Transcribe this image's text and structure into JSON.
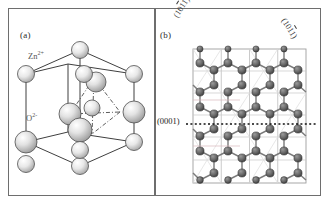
{
  "figure": {
    "caption_panels": [
      "(a)",
      "(b)"
    ],
    "background": "#ffffff",
    "border_color": "#6e6e6e"
  },
  "panel_a": {
    "tag": "(a)",
    "description": "wurtzite ZnO unit cell",
    "ion_labels": [
      {
        "name": "zinc-cation",
        "text": "Zn",
        "charge": "2+",
        "color": "#555555",
        "sphere_size": "small"
      },
      {
        "name": "oxygen-anion",
        "text": "O",
        "charge": "2-",
        "color": "#555555",
        "sphere_size": "large"
      }
    ],
    "bond_style": "solid-and-dash-dot",
    "sphere_fill": "#d8d8d8",
    "sphere_stroke": "#4a4a4a"
  },
  "panel_b": {
    "tag": "(b)",
    "description": "ZnO lattice projection with crystallographic planes",
    "planes": [
      {
        "name": "plane-left",
        "indices": "(1011)",
        "overline_digit": "1",
        "orientation": "rotated-left"
      },
      {
        "name": "plane-right",
        "indices": "(1011)",
        "overline_digit": "1",
        "orientation": "rotated-right"
      },
      {
        "name": "plane-basal",
        "indices": "(0001)",
        "orientation": "horizontal"
      }
    ],
    "lattice": {
      "columns": 4,
      "rows": 6,
      "atom_color": "#5e5e5e",
      "cell_line_color": "#b9b9b9",
      "basal_line_style": "dotted",
      "basal_line_color": "#111111"
    }
  }
}
